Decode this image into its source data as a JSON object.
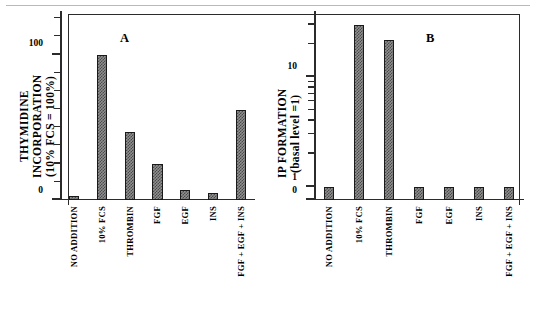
{
  "figure": {
    "panel_a_letter": "A",
    "panel_b_letter": "B"
  },
  "chart_data": [
    {
      "type": "bar",
      "panel": "A",
      "title": "A",
      "ylabel": "THYMIDINE INCORPORATION\n(10% FCS = 100%)",
      "xlabel": "",
      "scale": "linear",
      "ylim": [
        0,
        130
      ],
      "ytick_labels": [
        "0",
        "100"
      ],
      "ytick_values": [
        0,
        100
      ],
      "minor_ticks": [
        12.5,
        25,
        37.5,
        50,
        62.5,
        75,
        87.5,
        112.5,
        125
      ],
      "grid": false,
      "legend": "none",
      "categories": [
        "NO ADDITION",
        "10% FCS",
        "THROMBIN",
        "FGF",
        "EGF",
        "INS",
        "FGF + EGF + INS"
      ],
      "values": [
        3,
        100,
        47,
        25,
        7,
        5,
        62
      ]
    },
    {
      "type": "bar",
      "panel": "B",
      "title": "B",
      "ylabel": "IP FORMATION\n(basal  level  =1)",
      "xlabel": "",
      "scale": "log",
      "ylim": [
        1,
        40
      ],
      "ytick_labels": [
        "0",
        "1",
        "10"
      ],
      "ytick_values": [
        0,
        1,
        10
      ],
      "minor_ticks": [
        2,
        3,
        4,
        5,
        6,
        7,
        8,
        9,
        20,
        30
      ],
      "grid": false,
      "legend": "none",
      "categories": [
        "NO ADDITION",
        "10% FCS",
        "THROMBIN",
        "FGF",
        "EGF",
        "INS",
        "FGF + EGF + INS"
      ],
      "values": [
        1,
        30,
        22,
        1,
        1,
        1,
        1
      ]
    }
  ],
  "colors": {
    "bar_fill": "#8f8f8f",
    "bar_hatch": "#4a4a4a",
    "bar_edge": "#1a1a1a",
    "axis": "#2b2b2b",
    "rule": "#b9b9b9"
  }
}
